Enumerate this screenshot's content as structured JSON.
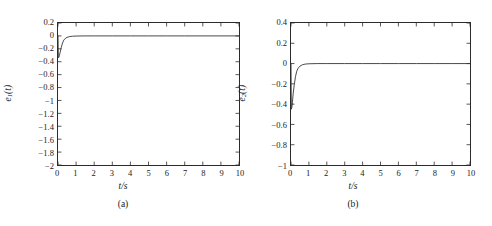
{
  "figure": {
    "background": "#ffffff",
    "line_color": "#333333",
    "axis_color": "#2b2b2b"
  },
  "panels": [
    {
      "caption": "(a)",
      "ylabel_base": "e",
      "ylabel_sub": "1",
      "ylabel_tail": "(t)",
      "xlabel": "t/s",
      "yticks": [
        "0.2",
        "0",
        "−0.2",
        "−0.4",
        "−0.6",
        "−0.8",
        "−1",
        "−1.2",
        "−1.4",
        "−1.6",
        "−1.8",
        "−2"
      ],
      "xticks": [
        "0",
        "1",
        "2",
        "3",
        "4",
        "5",
        "6",
        "7",
        "8",
        "9",
        "10"
      ]
    },
    {
      "caption": "(b)",
      "ylabel_base": "e",
      "ylabel_sub": "2",
      "ylabel_tail": "(t)",
      "xlabel": "t/s",
      "yticks": [
        "0.4",
        "0.2",
        "0",
        "−0.2",
        "−0.4",
        "−0.6",
        "−0.8",
        "−1"
      ],
      "xticks": [
        "0",
        "1",
        "2",
        "3",
        "4",
        "5",
        "6",
        "7",
        "8",
        "9",
        "10"
      ]
    }
  ],
  "chart_data": [
    {
      "type": "line",
      "title": "",
      "subtitle": "(a)",
      "xlabel": "t/s",
      "ylabel": "e1(t)",
      "xlim": [
        0,
        10
      ],
      "ylim": [
        -2,
        0.2
      ],
      "xticks": [
        0,
        1,
        2,
        3,
        4,
        5,
        6,
        7,
        8,
        9,
        10
      ],
      "yticks": [
        0.2,
        0,
        -0.2,
        -0.4,
        -0.6,
        -0.8,
        -1,
        -1.2,
        -1.4,
        -1.6,
        -1.8,
        -2
      ],
      "grid": false,
      "legend": "none",
      "series": [
        {
          "name": "e1(t)",
          "x": [
            0,
            0.02,
            0.05,
            0.08,
            0.12,
            0.18,
            0.25,
            0.32,
            0.4,
            0.5,
            0.65,
            0.8,
            1,
            1.5,
            2,
            3,
            4,
            5,
            6,
            7,
            8,
            9,
            10
          ],
          "values": [
            0,
            -0.34,
            -0.33,
            -0.3,
            -0.25,
            -0.18,
            -0.11,
            -0.065,
            -0.04,
            -0.022,
            -0.01,
            -0.005,
            -0.002,
            0,
            0,
            0,
            0,
            0,
            0,
            0,
            0,
            0,
            0
          ]
        }
      ]
    },
    {
      "type": "line",
      "title": "",
      "subtitle": "(b)",
      "xlabel": "t/s",
      "ylabel": "e2(t)",
      "xlim": [
        0,
        10
      ],
      "ylim": [
        -1,
        0.4
      ],
      "xticks": [
        0,
        1,
        2,
        3,
        4,
        5,
        6,
        7,
        8,
        9,
        10
      ],
      "yticks": [
        0.4,
        0.2,
        0,
        -0.2,
        -0.4,
        -0.6,
        -0.8,
        -1
      ],
      "grid": false,
      "legend": "none",
      "series": [
        {
          "name": "e2(t)",
          "x": [
            0,
            0.02,
            0.05,
            0.08,
            0.12,
            0.18,
            0.25,
            0.32,
            0.4,
            0.5,
            0.65,
            0.8,
            1,
            1.5,
            2,
            3,
            4,
            5,
            6,
            7,
            8,
            9,
            10
          ],
          "values": [
            0,
            -0.45,
            -0.43,
            -0.38,
            -0.3,
            -0.21,
            -0.13,
            -0.075,
            -0.045,
            -0.025,
            -0.011,
            -0.005,
            -0.002,
            0,
            0,
            0,
            0,
            0,
            0,
            0,
            0,
            0,
            0
          ]
        }
      ]
    }
  ]
}
